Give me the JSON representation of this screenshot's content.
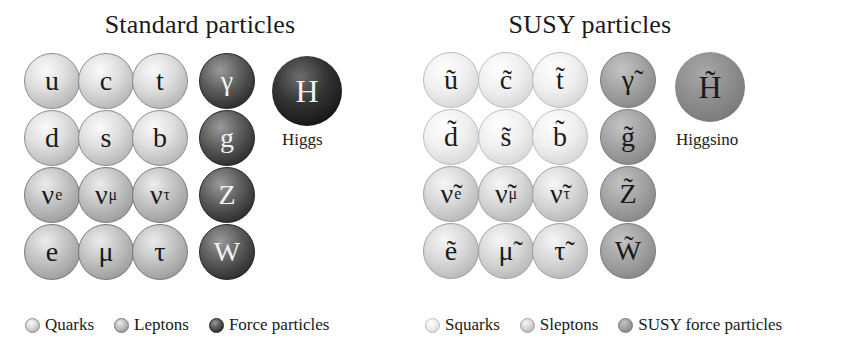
{
  "standard": {
    "title": "Standard particles",
    "grid": [
      [
        {
          "sym": "u",
          "sub": "",
          "type": "quark"
        },
        {
          "sym": "c",
          "sub": "",
          "type": "quark"
        },
        {
          "sym": "t",
          "sub": "",
          "type": "quark"
        },
        {
          "sym": "γ",
          "sub": "",
          "type": "force"
        }
      ],
      [
        {
          "sym": "d",
          "sub": "",
          "type": "quark"
        },
        {
          "sym": "s",
          "sub": "",
          "type": "quark"
        },
        {
          "sym": "b",
          "sub": "",
          "type": "quark"
        },
        {
          "sym": "g",
          "sub": "",
          "type": "force"
        }
      ],
      [
        {
          "sym": "ν",
          "sub": "e",
          "type": "lepton"
        },
        {
          "sym": "ν",
          "sub": "μ",
          "type": "lepton"
        },
        {
          "sym": "ν",
          "sub": "τ",
          "type": "lepton"
        },
        {
          "sym": "Z",
          "sub": "",
          "type": "force"
        }
      ],
      [
        {
          "sym": "e",
          "sub": "",
          "type": "lepton"
        },
        {
          "sym": "μ",
          "sub": "",
          "type": "lepton"
        },
        {
          "sym": "τ",
          "sub": "",
          "type": "lepton"
        },
        {
          "sym": "W",
          "sub": "",
          "type": "force"
        }
      ]
    ],
    "higgs": {
      "sym": "H",
      "label": "Higgs"
    },
    "legend": [
      {
        "label": "Quarks",
        "type": "quark"
      },
      {
        "label": "Leptons",
        "type": "lepton"
      },
      {
        "label": "Force particles",
        "type": "force"
      }
    ]
  },
  "susy": {
    "title": "SUSY particles",
    "grid": [
      [
        {
          "sym": "ũ",
          "sub": "",
          "type": "squark"
        },
        {
          "sym": "c̃",
          "sub": "",
          "type": "squark"
        },
        {
          "sym": "t̃",
          "sub": "",
          "type": "squark"
        },
        {
          "sym": "γ̃",
          "sub": "",
          "type": "sforce"
        }
      ],
      [
        {
          "sym": "d̃",
          "sub": "",
          "type": "squark"
        },
        {
          "sym": "s̃",
          "sub": "",
          "type": "squark"
        },
        {
          "sym": "b̃",
          "sub": "",
          "type": "squark"
        },
        {
          "sym": "g̃",
          "sub": "",
          "type": "sforce"
        }
      ],
      [
        {
          "sym": "ν̃",
          "sub": "e",
          "type": "slepton"
        },
        {
          "sym": "ν̃",
          "sub": "μ",
          "type": "slepton"
        },
        {
          "sym": "ν̃",
          "sub": "τ",
          "type": "slepton"
        },
        {
          "sym": "Z̃",
          "sub": "",
          "type": "sforce"
        }
      ],
      [
        {
          "sym": "ẽ",
          "sub": "",
          "type": "slepton"
        },
        {
          "sym": "μ̃",
          "sub": "",
          "type": "slepton"
        },
        {
          "sym": "τ̃",
          "sub": "",
          "type": "slepton"
        },
        {
          "sym": "W̃",
          "sub": "",
          "type": "sforce"
        }
      ]
    ],
    "higgs": {
      "sym": "H̃",
      "label": "Higgsino"
    },
    "legend": [
      {
        "label": "Squarks",
        "type": "squark"
      },
      {
        "label": "Sleptons",
        "type": "slepton"
      },
      {
        "label": "SUSY force particles",
        "type": "sforce"
      }
    ]
  }
}
